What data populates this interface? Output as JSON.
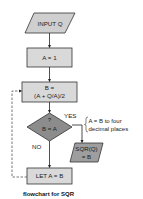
{
  "flowchart": {
    "caption": "flowchart for SQR",
    "colors": {
      "box_fill": "#d9d9d9",
      "input_fill": "#cfcfcf",
      "decision_fill": "#8c8c8c",
      "output_fill": "#9e9e9e",
      "stroke": "#333333",
      "loop_stroke": "#555555"
    },
    "nodes": {
      "input": {
        "shape": "parallelogram",
        "label": "INPUT Q"
      },
      "init": {
        "shape": "rectangle",
        "label": "A = 1"
      },
      "compute": {
        "shape": "rectangle",
        "line1": "B =",
        "line2": "(A + Q/A)/2"
      },
      "decision": {
        "shape": "diamond",
        "line1": "?",
        "line2": "B = A"
      },
      "output": {
        "shape": "parallelogram",
        "line1": "SQR(Q)",
        "line2": "= B"
      },
      "update": {
        "shape": "rectangle",
        "label": "LET A = B"
      }
    },
    "edges": {
      "yes_label": "YES",
      "no_label": "NO",
      "yes_note_line1": "A = B to four",
      "yes_note_line2": "decimal places"
    }
  }
}
